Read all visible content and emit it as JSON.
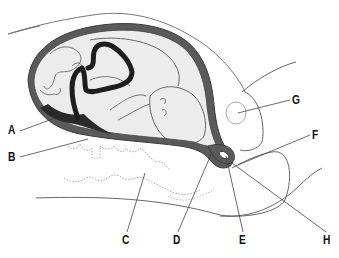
{
  "diagram": {
    "title": "",
    "colors": {
      "background": "#ffffff",
      "uterine_wall": "#5a5a5a",
      "uterine_wall_dark": "#2a2a2a",
      "amniotic_fill": "#ececec",
      "umbilical_cord": "#1e1e1e",
      "outline": "#555555",
      "dotted": "#aaaaaa",
      "label_text": "#111111",
      "leader_line": "#444444"
    },
    "labels": [
      {
        "id": "A",
        "text": "A",
        "x": 8,
        "y": 124,
        "target": [
          55,
          118
        ]
      },
      {
        "id": "B",
        "text": "B",
        "x": 8,
        "y": 151,
        "target": [
          88,
          139
        ]
      },
      {
        "id": "C",
        "text": "C",
        "x": 122,
        "y": 234,
        "target": [
          145,
          173
        ]
      },
      {
        "id": "D",
        "text": "D",
        "x": 173,
        "y": 234,
        "target": [
          212,
          152
        ]
      },
      {
        "id": "E",
        "text": "E",
        "x": 239,
        "y": 234,
        "target": [
          226,
          156
        ]
      },
      {
        "id": "F",
        "text": "F",
        "x": 312,
        "y": 129,
        "target": [
          238,
          165
        ]
      },
      {
        "id": "G",
        "text": "G",
        "x": 292,
        "y": 94,
        "target": [
          238,
          113
        ]
      },
      {
        "id": "H",
        "text": "H",
        "x": 323,
        "y": 234,
        "target": [
          232,
          163
        ]
      }
    ]
  }
}
